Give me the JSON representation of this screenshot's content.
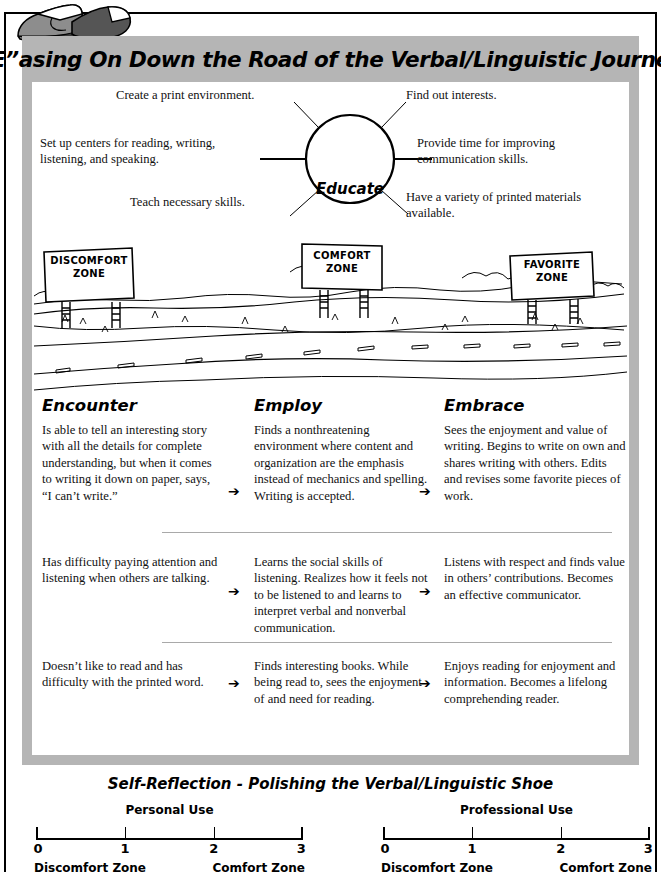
{
  "poster": {
    "title": "“E”asing On Down the Road of the Verbal/Linguistic Journey",
    "shoes_icon": "pair-of-shoes-icon"
  },
  "web_diagram": {
    "hub": "Educate",
    "spokes": [
      {
        "position": "top-left",
        "text": "Create a print environment."
      },
      {
        "position": "middle-left",
        "text": "Set up centers for reading, writing, listening, and speaking."
      },
      {
        "position": "bottom-left",
        "text": "Teach necessary skills."
      },
      {
        "position": "top-right",
        "text": "Find out interests."
      },
      {
        "position": "middle-right",
        "text": "Provide time for improving communication skills."
      },
      {
        "position": "bottom-right",
        "text": "Have a variety of printed materials available."
      }
    ]
  },
  "road_scene": {
    "signs": [
      {
        "line1": "DISCOMFORT",
        "line2": "ZONE"
      },
      {
        "line1": "COMFORT",
        "line2": "ZONE"
      },
      {
        "line1": "FAVORITE",
        "line2": "ZONE"
      }
    ]
  },
  "progression": {
    "columns": [
      "Encounter",
      "Employ",
      "Embrace"
    ],
    "arrow": "➔",
    "rows": [
      {
        "encounter": "Is able to tell an interesting story with all the details for complete understanding, but when it comes to writing it down on paper, says, “I can’t write.”",
        "employ": "Finds a nonthreatening environment where content and organization are the emphasis instead of mechanics and spelling. Writing is accepted.",
        "embrace": "Sees the enjoyment and value of writing. Begins to write on own and shares writing with others. Edits and revises some favorite pieces of work."
      },
      {
        "encounter": "Has difficulty paying attention and listening when others are talking.",
        "employ": "Learns the social skills of listening. Realizes how it feels not to be listened to and learns to interpret verbal and nonverbal communication.",
        "embrace": "Listens with respect and finds value in others’ contributions. Becomes an effective communicator."
      },
      {
        "encounter": "Doesn’t like to read and has difficulty with the printed word.",
        "employ": "Finds interesting books. While being read to, sees the enjoyment of and need for reading.",
        "embrace": "Enjoys reading for enjoyment and information. Becomes a lifelong comprehending reader."
      }
    ]
  },
  "self_reflection": {
    "title": "Self-Reflection - Polishing the Verbal/Linguistic Shoe",
    "scales": [
      {
        "label": "Personal Use",
        "ticks": [
          "0",
          "1",
          "2",
          "3"
        ],
        "low_label": "Discomfort  Zone",
        "high_label": "Comfort  Zone"
      },
      {
        "label": "Professional Use",
        "ticks": [
          "0",
          "1",
          "2",
          "3"
        ],
        "low_label": "Discomfort  Zone",
        "high_label": "Comfort  Zone"
      }
    ]
  },
  "colors": {
    "panel_gray": "#b5b5b5",
    "ink": "#000000",
    "sheet": "#ffffff",
    "divider": "#a9a9a9"
  }
}
